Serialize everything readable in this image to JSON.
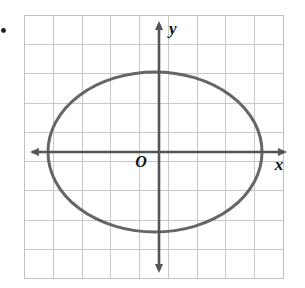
{
  "figure": {
    "kind": "coordinate-grid-graph",
    "background_color": "#ffffff",
    "bullet_marker": {
      "name": "item-bullet",
      "color": "#1a1a1a",
      "cx": 3.5,
      "cy": 30.5,
      "r": 2.4
    },
    "grid": {
      "left": 24,
      "top": 15,
      "right": 283,
      "bottom": 278,
      "columns": 9,
      "rows": 9,
      "cell_width": 28.8,
      "cell_height": 29.2,
      "line_color": "#c8c8c8",
      "line_width": 1,
      "border_color": "#c0c0c0"
    },
    "axes": {
      "color": "#555555",
      "line_width": 2.6,
      "origin_x": 159,
      "origin_y": 152,
      "x_axis": {
        "start": 30,
        "end": 287,
        "y": 152
      },
      "y_axis": {
        "start": 22,
        "end": 272,
        "x": 159
      },
      "arrowhead_length": 9,
      "arrowhead_width": 8
    },
    "labels": {
      "x_axis": "x",
      "y_axis": "y",
      "origin": "O",
      "x_pos": {
        "x": 279,
        "y": 170
      },
      "y_pos": {
        "x": 169,
        "y": 34
      },
      "origin_pos": {
        "x": 141,
        "y": 167
      },
      "font_size": 17,
      "origin_font_size": 16,
      "color": "#111111"
    }
  },
  "chart_data": {
    "type": "scatter",
    "title": "",
    "xlabel": "x",
    "ylabel": "y",
    "grid": true,
    "legend": null,
    "xlim": [
      -4.66,
      4.31
    ],
    "ylim": [
      -4.11,
      4.69
    ],
    "annotations": [
      {
        "text": "O",
        "x": -0.62,
        "y": -0.51,
        "note": "origin label"
      },
      {
        "text": "x",
        "x": 4.17,
        "y": -0.62,
        "note": "x-axis label"
      },
      {
        "text": "y",
        "x": 0.35,
        "y": 4.04,
        "note": "y-axis label"
      }
    ],
    "series": [
      {
        "name": "ellipse",
        "type": "conic-ellipse",
        "stroke_color": "#666666",
        "stroke_width": 3.0,
        "fill": "none",
        "center": {
          "x": -0.14,
          "y": 0.0
        },
        "center_px": {
          "x": 155,
          "y": 152
        },
        "semi_axis_x": 3.72,
        "semi_axis_y": 2.74,
        "semi_axis_x_px": 107,
        "semi_axis_y_px": 80,
        "vertices_px": [
          {
            "x": 48,
            "y": 152
          },
          {
            "x": 262,
            "y": 152
          },
          {
            "x": 155,
            "y": 72
          },
          {
            "x": 155,
            "y": 232
          }
        ],
        "orientation": "horizontal-major-axis"
      }
    ]
  }
}
